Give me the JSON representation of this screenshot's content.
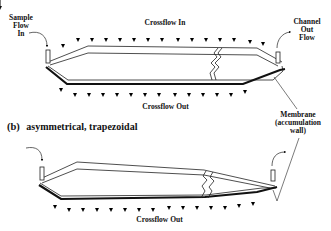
{
  "figure": {
    "panel_a": {
      "labels": {
        "sample_flow_in": [
          "Sample",
          "Flow",
          "In"
        ],
        "crossflow_in": "Crossflow  In",
        "channel_out_flow": [
          "Channel",
          "Out",
          "Flow"
        ],
        "crossflow_out": "Crossflow  Out"
      },
      "arrows_top_count": 11,
      "arrows_bottom_count": 12
    },
    "panel_b": {
      "tag": "(b)",
      "title": "asymmetrical, trapezoidal",
      "labels": {
        "membrane": [
          "Membrane",
          "(accumulation",
          "wall)"
        ],
        "crossflow_out": "Crossflow  Out"
      },
      "arrows_bottom_count": 11
    },
    "colors": {
      "ink": "#111111",
      "background": "#ffffff"
    }
  }
}
